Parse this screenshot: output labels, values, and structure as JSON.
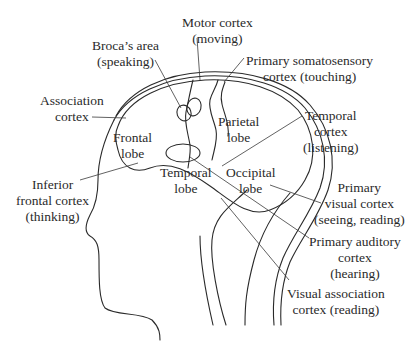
{
  "diagram": {
    "colors": {
      "line": "#2a2a2a",
      "leader": "#3a3a3a",
      "background": "#ffffff"
    },
    "lobes": [
      {
        "id": "frontal",
        "line1": "Frontal",
        "line2": "lobe"
      },
      {
        "id": "parietal",
        "line1": "Parietal",
        "line2": "lobe"
      },
      {
        "id": "temporal",
        "line1": "Temporal",
        "line2": "lobe"
      },
      {
        "id": "occipital",
        "line1": "Occipital",
        "line2": "lobe"
      }
    ],
    "callouts": [
      {
        "id": "motor-cortex",
        "line1": "Motor cortex",
        "line2": "(moving)"
      },
      {
        "id": "brocas-area",
        "line1": "Broca’s area",
        "line2": "(speaking)"
      },
      {
        "id": "primary-somatosensory",
        "line1": "Primary somatosensory",
        "line2": "cortex (touching)"
      },
      {
        "id": "association-cortex",
        "line1": "Association",
        "line2": "cortex"
      },
      {
        "id": "temporal-cortex",
        "line1": "Temporal",
        "line2": "cortex",
        "line3": "(listening)"
      },
      {
        "id": "inferior-frontal",
        "line1": "Inferior",
        "line2": "frontal cortex",
        "line3": "(thinking)"
      },
      {
        "id": "primary-visual",
        "line1": "Primary",
        "line2": "visual cortex",
        "line3": "(seeing, reading)"
      },
      {
        "id": "primary-auditory",
        "line1": "Primary auditory",
        "line2": "cortex",
        "line3": "(hearing)"
      },
      {
        "id": "visual-association",
        "line1": "Visual association",
        "line2": "cortex (reading)"
      }
    ]
  }
}
